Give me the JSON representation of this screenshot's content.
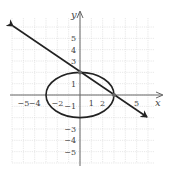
{
  "chart_data": {
    "type": "line",
    "title": "",
    "xlabel": "x",
    "ylabel": "y",
    "xlim": [
      -6,
      6.5
    ],
    "ylim": [
      -6,
      6.5
    ],
    "grid": true,
    "x_tick_labels": [
      "-5",
      "-4",
      "-2",
      "1",
      "2",
      "5"
    ],
    "y_tick_labels": [
      "5",
      "4",
      "3",
      "1",
      "-1",
      "-3",
      "-4",
      "-5"
    ],
    "series": [
      {
        "name": "ellipse",
        "kind": "ellipse",
        "equation": "x^2/9 + y^2/4 = 1",
        "center": [
          0,
          0
        ],
        "semi_axes": [
          3,
          2
        ]
      },
      {
        "name": "line",
        "kind": "line",
        "equation": "y = -2/3 x + 2",
        "points": [
          [
            -6,
            6
          ],
          [
            0,
            2
          ],
          [
            3,
            0
          ],
          [
            6,
            -2
          ]
        ],
        "arrows": "both"
      }
    ],
    "intersections": [
      [
        0,
        2
      ],
      [
        3,
        0
      ]
    ]
  },
  "colors": {
    "grid": "#d8d8d8",
    "axes": "#666666",
    "curve": "#222222"
  }
}
